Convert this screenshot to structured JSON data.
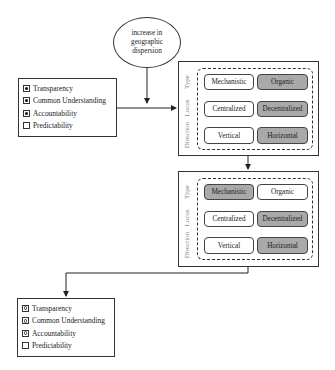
{
  "trigger": {
    "lines": [
      "increase in",
      "geographic",
      "dispersion"
    ]
  },
  "attribute_sets": [
    {
      "id": "initial",
      "items": [
        {
          "label": "Transparency",
          "mark": "filled-dot"
        },
        {
          "label": "Common Understanding",
          "mark": "filled-dot"
        },
        {
          "label": "Accountability",
          "mark": "filled-dot"
        },
        {
          "label": "Predictability",
          "mark": "empty"
        }
      ]
    },
    {
      "id": "final",
      "items": [
        {
          "label": "Transparency",
          "mark": "open-circle"
        },
        {
          "label": "Common Understanding",
          "mark": "open-circle"
        },
        {
          "label": "Accountability",
          "mark": "open-circle"
        },
        {
          "label": "Predictability",
          "mark": "empty"
        }
      ]
    }
  ],
  "configurations": [
    {
      "id": "first",
      "rows": [
        {
          "dimension": "Type",
          "options": [
            {
              "label": "Mechanistic",
              "selected": false
            },
            {
              "label": "Organic",
              "selected": true
            }
          ]
        },
        {
          "dimension": "Locus",
          "options": [
            {
              "label": "Centralized",
              "selected": false
            },
            {
              "label": "Decentralized",
              "selected": true
            }
          ]
        },
        {
          "dimension": "Direction",
          "options": [
            {
              "label": "Vertical",
              "selected": false
            },
            {
              "label": "Horizontal",
              "selected": true
            }
          ]
        }
      ]
    },
    {
      "id": "second",
      "rows": [
        {
          "dimension": "Type",
          "options": [
            {
              "label": "Mechanistic",
              "selected": true
            },
            {
              "label": "Organic",
              "selected": false
            }
          ]
        },
        {
          "dimension": "Locus",
          "options": [
            {
              "label": "Centralized",
              "selected": false
            },
            {
              "label": "Decentralized",
              "selected": true
            }
          ]
        },
        {
          "dimension": "Direction",
          "options": [
            {
              "label": "Vertical",
              "selected": false
            },
            {
              "label": "Horizontal",
              "selected": true
            }
          ]
        }
      ]
    }
  ],
  "colors": {
    "selected_fill": "#a9a9a9",
    "line": "#333333",
    "dimension_label": "#888888"
  }
}
